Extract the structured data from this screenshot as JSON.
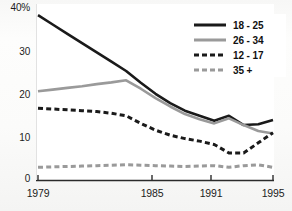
{
  "chart_data": {
    "type": "line",
    "title": "",
    "subtitle": "",
    "xlabel": "",
    "ylabel": "",
    "x": [
      1979,
      1980,
      1981,
      1982,
      1983,
      1984,
      1985,
      1986,
      1987,
      1988,
      1989,
      1990,
      1991,
      1992,
      1993,
      1994,
      1995
    ],
    "xlim": [
      1979,
      1995
    ],
    "ylim": [
      0,
      40
    ],
    "xticks": [
      1979,
      1985,
      1991,
      1995
    ],
    "xtick_labels": [
      "1979",
      "1985",
      "1991",
      "1995"
    ],
    "yticks": [
      0,
      10,
      20,
      30,
      40
    ],
    "ytick_labels": [
      "0",
      "10",
      "20",
      "30",
      "40%"
    ],
    "grid": false,
    "legend_position": "top-right",
    "series": [
      {
        "name": "18 - 25",
        "color": "#1a1a1a",
        "style": "solid",
        "values": [
          39.0,
          36.8,
          34.6,
          32.4,
          30.2,
          28.0,
          25.8,
          23.0,
          20.4,
          18.2,
          16.4,
          15.2,
          14.0,
          15.2,
          13.0,
          13.2,
          14.2
        ]
      },
      {
        "name": "26 - 34",
        "color": "#9a9a9a",
        "style": "solid",
        "values": [
          21.0,
          21.4,
          21.8,
          22.2,
          22.7,
          23.1,
          23.6,
          21.6,
          19.4,
          17.4,
          15.6,
          14.4,
          13.4,
          14.6,
          13.0,
          11.6,
          11.0
        ]
      },
      {
        "name": "12 - 17",
        "color": "#1a1a1a",
        "style": "dashed",
        "values": [
          17.0,
          16.8,
          16.6,
          16.4,
          16.2,
          15.8,
          15.2,
          13.4,
          11.8,
          10.6,
          9.8,
          9.2,
          8.4,
          6.4,
          6.4,
          8.8,
          11.2
        ]
      },
      {
        "name": "35+",
        "color": "#9a9a9a",
        "style": "dashed",
        "values": [
          3.0,
          3.1,
          3.2,
          3.3,
          3.4,
          3.5,
          3.6,
          3.5,
          3.4,
          3.3,
          3.2,
          3.3,
          3.4,
          3.0,
          3.4,
          3.6,
          3.0
        ]
      }
    ]
  },
  "axis": {
    "y_labels": [
      "40%",
      "30",
      "20",
      "10",
      "0"
    ],
    "x_labels": [
      "1979",
      "1985",
      "1991",
      "1995"
    ]
  },
  "legend": {
    "entries": [
      {
        "label": "18 - 25",
        "swatch": "solid-dark"
      },
      {
        "label": "26 - 34",
        "swatch": "solid-gray"
      },
      {
        "label": "12 - 17",
        "swatch": "dash-dark"
      },
      {
        "label": "35 +",
        "swatch": "dash-gray"
      }
    ]
  },
  "footer": {
    "caption": ""
  },
  "colors": {
    "series_dark": "#1a1a1a",
    "series_gray": "#9a9a9a",
    "axis": "#2b2b2b",
    "text": "#1c1c1c",
    "background": "#fbfbfa"
  }
}
